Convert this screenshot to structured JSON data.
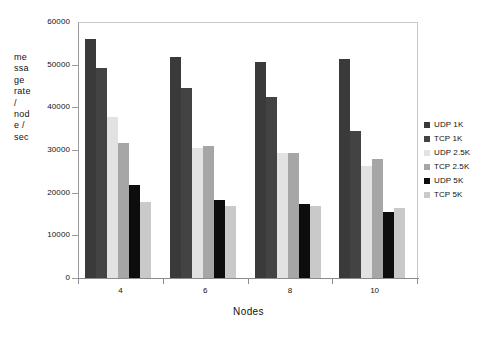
{
  "chart_data": {
    "type": "bar",
    "title": "",
    "subtitle": "",
    "xlabel": "Nodes",
    "ylabel": "message rate / node / sec",
    "ylabel_wrapped": "me\nssa\nge\nrate\n/\nnod\ne /\nsec",
    "categories": [
      "4",
      "6",
      "8",
      "10"
    ],
    "ylim": [
      0,
      60000
    ],
    "yticks": [
      0,
      10000,
      20000,
      30000,
      40000,
      50000,
      60000
    ],
    "ytick_labels": [
      "0",
      "10000",
      "20000",
      "30000",
      "40000",
      "50000",
      "60000"
    ],
    "grid": false,
    "legend_position": "right",
    "series": [
      {
        "name": "UDP 1K",
        "color": "#3a3a3a",
        "values": [
          56000,
          51900,
          50700,
          51400
        ]
      },
      {
        "name": "TCP 1K",
        "color": "#434343",
        "values": [
          49300,
          44500,
          42500,
          34500
        ]
      },
      {
        "name": "UDP 2.5K",
        "color": "#e2e2e2",
        "values": [
          37700,
          30500,
          29400,
          26300
        ]
      },
      {
        "name": "TCP 2.5K",
        "color": "#a6a6a6",
        "values": [
          31600,
          30900,
          29200,
          27800
        ]
      },
      {
        "name": "UDP 5K",
        "color": "#0d0d0d",
        "values": [
          21700,
          18200,
          17400,
          15400
        ]
      },
      {
        "name": "TCP 5K",
        "color": "#c9c9c9",
        "values": [
          17800,
          16800,
          16800,
          16300
        ]
      }
    ]
  },
  "axis": {
    "y_title": "me\nssa\nge\nrate\n/\nnod\ne /\nsec",
    "x_title": "Nodes"
  }
}
